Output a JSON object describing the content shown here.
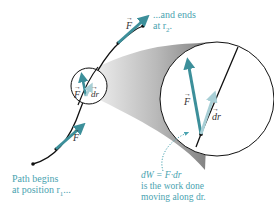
{
  "figure": {
    "colors": {
      "path": "#111111",
      "force_arrow": "#3c8f9a",
      "displacement_arrow": "#a8cfd6",
      "caption_text": "#4aa3b0",
      "magnifier_gradient_dark": "#8a8a8a",
      "magnifier_gradient_light": "#e8e8e8"
    },
    "labels": {
      "force": "F",
      "displacement": "dr",
      "start_caption_line1": "Path begins",
      "start_caption_line2": "at position r",
      "start_caption_sub": "1",
      "start_caption_tail": "...",
      "end_caption_line1": "...and ends",
      "end_caption_line2": "at r",
      "end_caption_sub": "2",
      "end_caption_tail": ".",
      "work_line1": "dW = F·dr",
      "work_line2": "is the work done",
      "work_line3": "moving along dr."
    }
  }
}
